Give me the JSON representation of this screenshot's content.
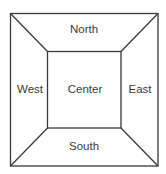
{
  "diagram": {
    "type": "border-layout",
    "colors": {
      "background": "#ffffff",
      "line": "#3a3a3a",
      "text": "#3a3a3a"
    },
    "regions": {
      "north": {
        "label": "North",
        "x": 84,
        "y": 30
      },
      "west": {
        "label": "West",
        "x": 30,
        "y": 90
      },
      "center": {
        "label": "Center",
        "x": 85,
        "y": 90
      },
      "east": {
        "label": "East",
        "x": 140,
        "y": 90
      },
      "south": {
        "label": "South",
        "x": 84,
        "y": 147
      }
    }
  }
}
